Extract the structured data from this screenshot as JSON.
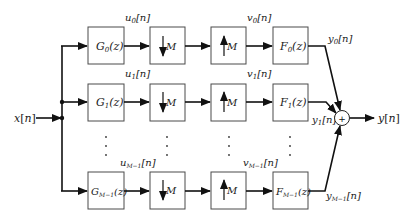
{
  "diagram": {
    "input_label": "x[n]",
    "output_label": "y[n]",
    "summer_symbol": "+",
    "channels": [
      {
        "analysis_filter": "G₀(z)",
        "decimator": "↓M",
        "subband_signal": "u₀[n]",
        "expander": "↑M",
        "upsampled_signal": "v₀[n]",
        "synthesis_filter": "F₀(z)",
        "branch_output": "y₀[n]"
      },
      {
        "analysis_filter": "G₁(z)",
        "decimator": "↓M",
        "subband_signal": "u₁[n]",
        "expander": "↑M",
        "upsampled_signal": "v₁[n]",
        "synthesis_filter": "F₁(z)",
        "branch_output": "y₁[n]"
      },
      {
        "analysis_filter": "Gₘ₋₁(z)",
        "decimator": "↓M",
        "subband_signal": "uₘ₋₁[n]",
        "expander": "↑M",
        "upsampled_signal": "vₘ₋₁[n]",
        "synthesis_filter": "Fₘ₋₁(z)",
        "branch_output": "yₘ₋₁[n]"
      }
    ],
    "labels": {
      "G0": "G",
      "G0_sub": "0",
      "G1": "G",
      "G1_sub": "1",
      "G2": "G",
      "G2_sub": "M−1",
      "F0": "F",
      "F0_sub": "0",
      "F1": "F",
      "F1_sub": "1",
      "F2": "F",
      "F2_sub": "M−1",
      "z_arg": "(z)",
      "M": "M",
      "u": "u",
      "v": "v",
      "y": "y",
      "n_idx": "[n]",
      "sub0": "0",
      "sub1": "1",
      "subM1": "M−1",
      "x": "x",
      "yout": "y",
      "plus": "+",
      "dots": "⋮"
    }
  }
}
